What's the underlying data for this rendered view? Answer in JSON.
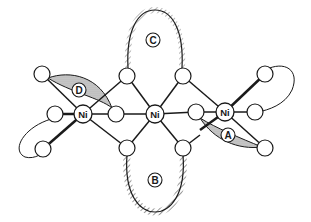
{
  "diagram": {
    "type": "molecular orbital / structure diagram",
    "atoms": {
      "ni_left": {
        "label": "Ni",
        "x": 83,
        "y": 114
      },
      "ni_center": {
        "label": "Ni",
        "x": 155,
        "y": 114
      },
      "ni_right": {
        "label": "Ni",
        "x": 225,
        "y": 112
      }
    },
    "lobes": [
      {
        "id": "A",
        "label": "A",
        "style": "dotted-shade",
        "x": 228,
        "y": 135
      },
      {
        "id": "B",
        "label": "B",
        "style": "hatched",
        "x": 155,
        "y": 180
      },
      {
        "id": "C",
        "label": "C",
        "style": "hatched",
        "x": 153,
        "y": 40
      },
      {
        "id": "D",
        "label": "D",
        "style": "dotted-shade",
        "x": 79,
        "y": 90
      }
    ],
    "colors": {
      "line": "#1a1a1a",
      "shade": "#bdbdbd",
      "background": "#ffffff"
    }
  }
}
